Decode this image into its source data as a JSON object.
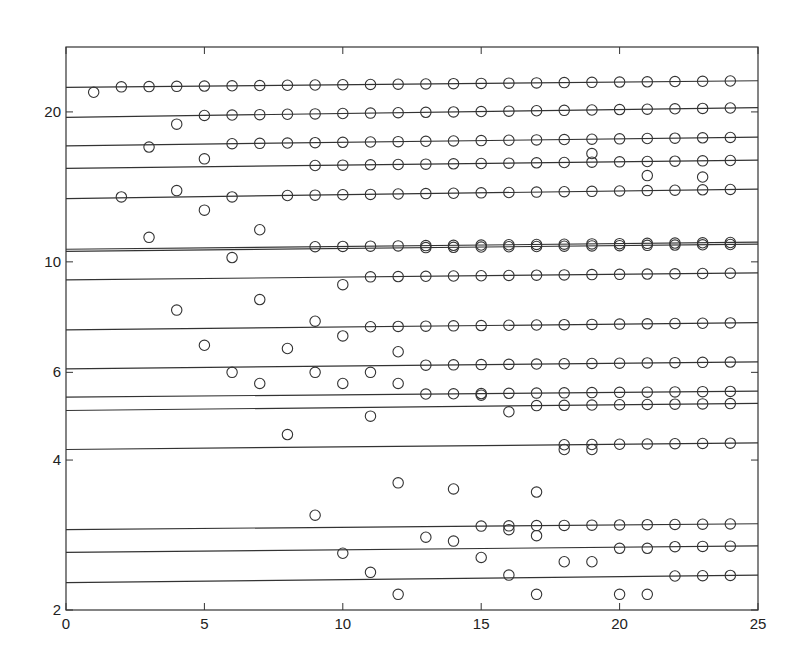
{
  "chart_data": {
    "type": "scatter",
    "title": "",
    "xlabel": "",
    "ylabel": "",
    "xlim": [
      0,
      25
    ],
    "ylim": [
      2,
      27
    ],
    "yscale": "log",
    "grid": false,
    "legend": null,
    "x_ticks": [
      0,
      5,
      10,
      15,
      20,
      25
    ],
    "x_tick_labels": [
      "0",
      "5",
      "10",
      "15",
      "20",
      "25"
    ],
    "y_ticks": [
      2,
      4,
      6,
      10,
      20
    ],
    "y_tick_labels": [
      "2",
      "4",
      "6",
      "10",
      "20"
    ],
    "marker": "open-circle",
    "colors": {
      "line": "#333333",
      "marker": "#333333",
      "axis": "#333333",
      "background": "#ffffff"
    },
    "horizontal_lines": [
      {
        "y_left": 22.4,
        "y_right": 23.1,
        "converged_from_x": 2
      },
      {
        "y_left": 19.5,
        "y_right": 20.4,
        "converged_from_x": 5
      },
      {
        "y_left": 17.1,
        "y_right": 17.8,
        "converged_from_x": 6
      },
      {
        "y_left": 15.4,
        "y_right": 16.0,
        "converged_from_x": 9
      },
      {
        "y_left": 13.4,
        "y_right": 14.0,
        "converged_from_x": 8
      },
      {
        "y_left": 10.6,
        "y_right": 10.95,
        "converged_from_x": 9
      },
      {
        "y_left": 10.5,
        "y_right": 10.85,
        "converged_from_x": 13
      },
      {
        "y_left": 9.2,
        "y_right": 9.5,
        "converged_from_x": 11
      },
      {
        "y_left": 7.3,
        "y_right": 7.55,
        "converged_from_x": 11
      },
      {
        "y_left": 6.1,
        "y_right": 6.3,
        "converged_from_x": 13
      },
      {
        "y_left": 5.35,
        "y_right": 5.5,
        "converged_from_x": 13
      },
      {
        "y_left": 5.03,
        "y_right": 5.2,
        "converged_from_x": 17
      },
      {
        "y_left": 4.2,
        "y_right": 4.33,
        "converged_from_x": 18
      },
      {
        "y_left": 2.9,
        "y_right": 2.98,
        "converged_from_x": 15
      },
      {
        "y_left": 2.61,
        "y_right": 2.69,
        "converged_from_x": 22
      },
      {
        "y_left": 2.27,
        "y_right": 2.35,
        "converged_from_x": 22
      }
    ],
    "scattered_points": [
      {
        "x": 1,
        "y": 21.9
      },
      {
        "x": 4,
        "y": 18.9
      },
      {
        "x": 3,
        "y": 17.0
      },
      {
        "x": 5,
        "y": 16.1
      },
      {
        "x": 2,
        "y": 13.5
      },
      {
        "x": 4,
        "y": 13.9
      },
      {
        "x": 5,
        "y": 12.7
      },
      {
        "x": 6,
        "y": 13.5
      },
      {
        "x": 3,
        "y": 11.2
      },
      {
        "x": 7,
        "y": 11.6
      },
      {
        "x": 6,
        "y": 10.2
      },
      {
        "x": 10,
        "y": 9.0
      },
      {
        "x": 4,
        "y": 8.0
      },
      {
        "x": 7,
        "y": 8.4
      },
      {
        "x": 9,
        "y": 7.6
      },
      {
        "x": 10,
        "y": 7.1
      },
      {
        "x": 5,
        "y": 6.8
      },
      {
        "x": 8,
        "y": 6.7
      },
      {
        "x": 12,
        "y": 6.6
      },
      {
        "x": 6,
        "y": 6.0
      },
      {
        "x": 9,
        "y": 6.0
      },
      {
        "x": 11,
        "y": 6.0
      },
      {
        "x": 7,
        "y": 5.7
      },
      {
        "x": 10,
        "y": 5.7
      },
      {
        "x": 12,
        "y": 5.7
      },
      {
        "x": 15,
        "y": 5.4
      },
      {
        "x": 16,
        "y": 5.0
      },
      {
        "x": 11,
        "y": 4.9
      },
      {
        "x": 8,
        "y": 4.5
      },
      {
        "x": 12,
        "y": 3.6
      },
      {
        "x": 14,
        "y": 3.5
      },
      {
        "x": 17,
        "y": 3.45
      },
      {
        "x": 9,
        "y": 3.1
      },
      {
        "x": 13,
        "y": 2.8
      },
      {
        "x": 14,
        "y": 2.75
      },
      {
        "x": 17,
        "y": 2.82
      },
      {
        "x": 16,
        "y": 2.9
      },
      {
        "x": 10,
        "y": 2.6
      },
      {
        "x": 15,
        "y": 2.55
      },
      {
        "x": 18,
        "y": 2.5
      },
      {
        "x": 19,
        "y": 2.5
      },
      {
        "x": 20,
        "y": 2.66
      },
      {
        "x": 21,
        "y": 2.66
      },
      {
        "x": 11,
        "y": 2.38
      },
      {
        "x": 16,
        "y": 2.35
      },
      {
        "x": 12,
        "y": 2.15
      },
      {
        "x": 17,
        "y": 2.15
      },
      {
        "x": 20,
        "y": 2.15
      },
      {
        "x": 21,
        "y": 2.15
      },
      {
        "x": 19,
        "y": 16.5
      },
      {
        "x": 21,
        "y": 14.9
      },
      {
        "x": 23,
        "y": 14.8
      },
      {
        "x": 18,
        "y": 4.2
      },
      {
        "x": 19,
        "y": 4.2
      }
    ]
  }
}
